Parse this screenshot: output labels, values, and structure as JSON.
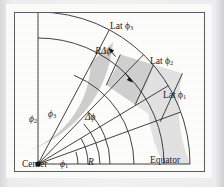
{
  "figure": {
    "caption_labels": {
      "lat3": "Lat ϕ",
      "lat3_sub": "3",
      "lat2": "Lat ϕ",
      "lat2_sub": "2",
      "lat1": "Lat ϕ",
      "lat1_sub": "1",
      "arc_length": "RΔϕ",
      "delta_phi": "Δϕ",
      "phi2": "ϕ",
      "phi2_sub": "2",
      "phi3": "ϕ",
      "phi3_sub": "3",
      "phi1": "ϕ",
      "phi1_sub": "1",
      "center": "Center",
      "radius": "R",
      "equator": "Equator"
    },
    "colors": {
      "page_background": "#e9e9ea",
      "mat": "#fbfbfa",
      "panel": "#fdfdfc",
      "frame_stroke": "#5b5b5b",
      "line": "#2b2b2b",
      "cell_fill_dark": "#cfcfcf",
      "cell_fill_light": "#e0e0e0",
      "text": "#1a1a1a"
    },
    "geometry": {
      "center_x": 24,
      "center_y": 152,
      "radii": [
        40,
        62,
        96,
        126,
        152
      ],
      "angles_deg": [
        0,
        11,
        20,
        31,
        46,
        62,
        90
      ],
      "description": "quarter circular sector from Center with radial lines at latitudes and concentric latitude arcs"
    }
  }
}
